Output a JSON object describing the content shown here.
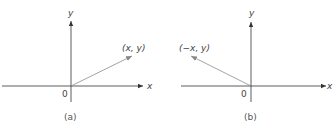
{
  "panels": [
    {
      "caption": "(a)",
      "axis_x_label": "x",
      "axis_y_label": "y",
      "origin_label": "0",
      "point_label": "(x, y)",
      "vector_direction": "up-right"
    },
    {
      "caption": "(b)",
      "axis_x_label": "x",
      "axis_y_label": "y",
      "origin_label": "0",
      "point_label": "(−x, y)",
      "vector_direction": "up-left"
    }
  ],
  "colors": {
    "axis": "#333333",
    "vector": "#8a8a8a",
    "text": "#444444"
  }
}
